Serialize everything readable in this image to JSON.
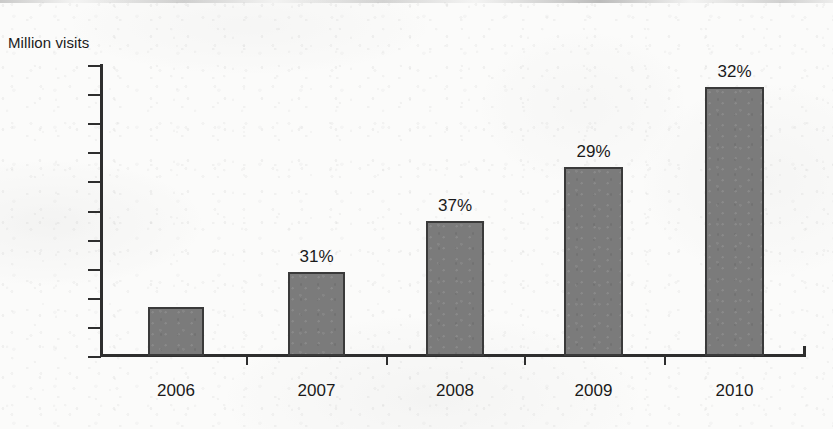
{
  "chart_data": {
    "type": "bar",
    "title": "",
    "subtitle": "",
    "xlabel": "",
    "ylabel": "Million visits",
    "categories": [
      "2006",
      "2007",
      "2008",
      "2009",
      "2010"
    ],
    "values": [
      0.18,
      0.31,
      0.5,
      0.7,
      1.0
    ],
    "value_unit": "million visits (relative, axis unlabeled)",
    "data_labels": [
      "",
      "31%",
      "37%",
      "29%",
      "32%"
    ],
    "data_label_meaning": "year-over-year growth rate",
    "ylim": [
      0,
      1.08
    ],
    "y_tick_count": 11,
    "y_tick_labels": [],
    "grid": false,
    "legend": null,
    "legend_position": "none",
    "bar_fill_color": "#7b7b7b",
    "bar_border_color": "#3a3a3a",
    "axis_color": "#2e2e2e",
    "background_color": "#fbfbfa"
  }
}
